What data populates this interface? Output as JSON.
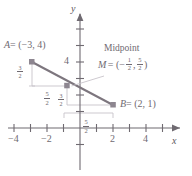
{
  "figure": {
    "kind": "coordinate-plane-midpoint-diagram",
    "colors": {
      "axis": "#6f6a71",
      "segment": "#7d767e",
      "point": "#8d8690",
      "guide": "#bdb9bf",
      "text": "#6f6a71",
      "background": "#ffffff"
    },
    "axes": {
      "x_axis_label": "x",
      "y_axis_label": "y",
      "x_ticks": [
        {
          "value": -5,
          "label": ""
        },
        {
          "value": -4,
          "label": "−4"
        },
        {
          "value": -3,
          "label": ""
        },
        {
          "value": -2,
          "label": "−2"
        },
        {
          "value": -1,
          "label": ""
        },
        {
          "value": 1,
          "label": ""
        },
        {
          "value": 2,
          "label": "2"
        },
        {
          "value": 3,
          "label": ""
        },
        {
          "value": 4,
          "label": "4"
        },
        {
          "value": 5,
          "label": ""
        }
      ],
      "y_ticks": [
        {
          "value": 1,
          "label": ""
        },
        {
          "value": 2,
          "label": ""
        },
        {
          "value": 3,
          "label": ""
        },
        {
          "value": 4,
          "label": "4"
        },
        {
          "value": 5,
          "label": ""
        },
        {
          "value": 6,
          "label": ""
        },
        {
          "value": -1,
          "label": ""
        },
        {
          "value": -2,
          "label": ""
        }
      ],
      "xlim": [
        -5.6,
        5.8
      ],
      "ylim": [
        -2.9,
        6.6
      ]
    },
    "points": [
      {
        "name": "A",
        "x": -3,
        "y": 4,
        "label": "A = (−3, 4)"
      },
      {
        "name": "M",
        "x": -0.5,
        "y": 2.5,
        "label": "M = (− 1/2 , 5/2 )"
      },
      {
        "name": "B",
        "x": 2,
        "y": 1,
        "label": "B = (2, 1)"
      }
    ],
    "labels": {
      "point_a": {
        "var": "A",
        "eq": "= (−3, 4)"
      },
      "midpoint_title": "Midpoint",
      "midpoint_var": "M",
      "midpoint_eq_open": "= (−",
      "midpoint_frac1_num": "1",
      "midpoint_frac1_den": "2",
      "midpoint_comma": ",",
      "midpoint_frac2_num": "5",
      "midpoint_frac2_den": "2",
      "midpoint_eq_close": ")",
      "point_b": {
        "var": "B",
        "eq": "= (2, 1)"
      },
      "y_tick_four": "4",
      "x_tick_minus_four": "−4",
      "x_tick_minus_two": "−2",
      "x_tick_two": "2",
      "x_tick_four": "4",
      "axis_x": "x",
      "axis_y": "y",
      "rise_left_num": "3",
      "rise_left_den": "2",
      "run_mid_num": "5",
      "run_mid_den": "2",
      "rise_mid_num": "3",
      "rise_mid_den": "2",
      "run_axis_num": "5",
      "run_axis_den": "2"
    },
    "segment": {
      "from": "A",
      "to": "B",
      "through": "M"
    },
    "guides": [
      "vertical drop from A to horizontal through M",
      "horizontal from A-drop to M",
      "vertical drop from M toward horizontal through B",
      "horizontal from M-drop to B",
      "bracket on x-axis spanning 5/2"
    ]
  }
}
